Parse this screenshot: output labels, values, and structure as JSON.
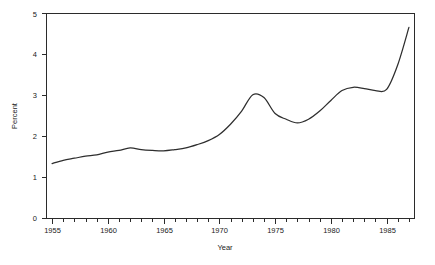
{
  "chart_data": {
    "type": "line",
    "title": "",
    "subtitle": "",
    "xlabel": "Year",
    "ylabel": "Percent",
    "xlim": [
      1954.5,
      1987.5
    ],
    "ylim": [
      0,
      5
    ],
    "grid": false,
    "legend": false,
    "legend_position": "none",
    "line_color": "#2e2e2e",
    "axis_color": "#2b2b2b",
    "background_color": "#ffffff",
    "x_major_ticks": [
      1955,
      1960,
      1965,
      1970,
      1975,
      1980,
      1985
    ],
    "x_major_tick_labels": [
      "1955",
      "1960",
      "1965",
      "1970",
      "1975",
      "1980",
      "1985"
    ],
    "x_minor_tick_interval": 1,
    "y_major_ticks": [
      0,
      1,
      2,
      3,
      4,
      5
    ],
    "y_major_tick_labels": [
      "0",
      "1",
      "2",
      "3",
      "4",
      "5"
    ],
    "series": [
      {
        "name": "Percent",
        "x": [
          1955,
          1956,
          1957,
          1958,
          1959,
          1960,
          1961,
          1962,
          1963,
          1964,
          1965,
          1966,
          1967,
          1968,
          1969,
          1970,
          1971,
          1972,
          1973,
          1974,
          1975,
          1976,
          1977,
          1978,
          1979,
          1980,
          1981,
          1982,
          1983,
          1984,
          1985,
          1986,
          1987
        ],
        "values": [
          1.34,
          1.42,
          1.47,
          1.52,
          1.55,
          1.62,
          1.66,
          1.72,
          1.68,
          1.66,
          1.65,
          1.68,
          1.72,
          1.8,
          1.9,
          2.05,
          2.3,
          2.62,
          3.02,
          2.95,
          2.56,
          2.42,
          2.33,
          2.42,
          2.62,
          2.88,
          3.12,
          3.2,
          3.17,
          3.12,
          3.15,
          3.75,
          4.66
        ]
      }
    ]
  }
}
